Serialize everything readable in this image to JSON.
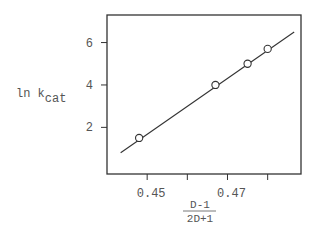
{
  "chart_data": {
    "type": "scatter",
    "title": "",
    "xlabel_numerator": "D-1",
    "xlabel_denominator": "2D+1",
    "xlabel": "(D-1)/(2D+1)",
    "ylabel_main": "ln k",
    "ylabel_sub": "cat",
    "ylabel": "ln k_cat",
    "x_ticks": [
      0.45,
      0.46,
      0.47,
      0.48
    ],
    "x_tick_labels": [
      "0.45",
      "",
      "0.47",
      ""
    ],
    "y_ticks": [
      2,
      4,
      6
    ],
    "y_tick_labels": [
      "2",
      "4",
      "6"
    ],
    "xlim": [
      0.44,
      0.4883
    ],
    "ylim": [
      -0.2,
      7.3
    ],
    "grid": false,
    "legend": null,
    "series": [
      {
        "name": "data",
        "marker": "open-circle",
        "x": [
          0.448,
          0.467,
          0.475,
          0.48
        ],
        "y": [
          1.5,
          4.0,
          5.0,
          5.7
        ]
      }
    ],
    "fit_line": {
      "x": [
        0.4434,
        0.4866
      ],
      "y": [
        0.8,
        6.5
      ]
    }
  }
}
